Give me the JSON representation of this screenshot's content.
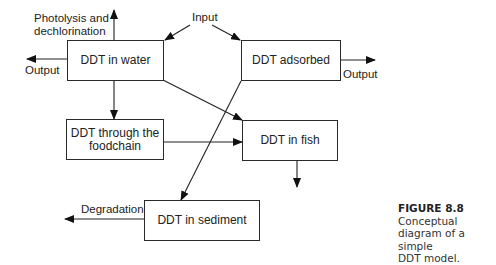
{
  "diagram": {
    "boxes": {
      "water": "DDT in water",
      "adsorbed": "DDT adsorbed",
      "foodchain_line1": "DDT through the",
      "foodchain_line2": "foodchain",
      "fish": "DDT in fish",
      "sediment": "DDT in sediment"
    },
    "labels": {
      "photolysis_line1": "Photolysis and",
      "photolysis_line2": "dechlorination",
      "input": "Input",
      "output_left": "Output",
      "output_right": "Output",
      "degradation": "Degradation"
    },
    "edges": [
      {
        "from": "Input",
        "to": "DDT in water"
      },
      {
        "from": "Input",
        "to": "DDT adsorbed"
      },
      {
        "from": "DDT in water",
        "to": "Photolysis and dechlorination"
      },
      {
        "from": "DDT in water",
        "to": "Output"
      },
      {
        "from": "DDT in water",
        "to": "DDT through the foodchain"
      },
      {
        "from": "DDT in water",
        "to": "DDT in fish"
      },
      {
        "from": "DDT adsorbed",
        "to": "Output"
      },
      {
        "from": "DDT adsorbed",
        "to": "DDT in sediment"
      },
      {
        "from": "DDT through the foodchain",
        "to": "DDT in fish"
      },
      {
        "from": "DDT in fish",
        "to": "(out)"
      },
      {
        "from": "DDT in sediment",
        "to": "Degradation"
      }
    ]
  },
  "caption": {
    "figure_label": "FIGURE 8.8",
    "text_line1": "Conceptual",
    "text_line2": "diagram of a simple",
    "text_line3": "DDT model."
  }
}
